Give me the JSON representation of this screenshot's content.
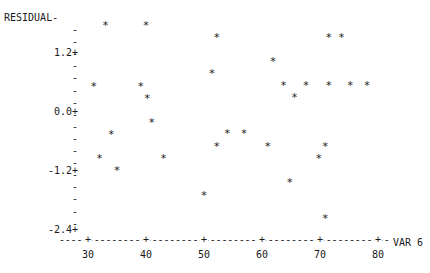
{
  "chart_data": {
    "type": "scatter",
    "title": "",
    "xlabel": "VAR 6",
    "ylabel": "RESIDUAL",
    "xlim": [
      26,
      84
    ],
    "ylim": [
      -2.6,
      1.9
    ],
    "x_ticks": [
      30,
      40,
      50,
      60,
      70,
      80
    ],
    "y_ticks": [
      1.2,
      0.0,
      -1.2,
      -2.4
    ],
    "y_tick_labels": [
      "1.2+",
      "0.0+",
      "-1.2+",
      "-2.4+"
    ],
    "grid": false,
    "legend": null,
    "marker": "*",
    "style": "line-printer",
    "series": [
      {
        "name": "residuals",
        "points": [
          {
            "x": 33.0,
            "y": 1.76
          },
          {
            "x": 40.0,
            "y": 1.76
          },
          {
            "x": 31.0,
            "y": 0.53
          },
          {
            "x": 39.1,
            "y": 0.53
          },
          {
            "x": 40.2,
            "y": 0.28
          },
          {
            "x": 41.0,
            "y": -0.2
          },
          {
            "x": 34.0,
            "y": -0.45
          },
          {
            "x": 32.0,
            "y": -0.94
          },
          {
            "x": 43.0,
            "y": -0.94
          },
          {
            "x": 35.0,
            "y": -1.18
          },
          {
            "x": 52.2,
            "y": 1.52
          },
          {
            "x": 51.4,
            "y": 0.79
          },
          {
            "x": 61.9,
            "y": 1.04
          },
          {
            "x": 63.7,
            "y": 0.55
          },
          {
            "x": 67.6,
            "y": 0.55
          },
          {
            "x": 65.6,
            "y": 0.3
          },
          {
            "x": 71.5,
            "y": 1.52
          },
          {
            "x": 73.7,
            "y": 1.52
          },
          {
            "x": 71.5,
            "y": 0.55
          },
          {
            "x": 75.2,
            "y": 0.55
          },
          {
            "x": 78.1,
            "y": 0.55
          },
          {
            "x": 54.0,
            "y": -0.43
          },
          {
            "x": 56.9,
            "y": -0.43
          },
          {
            "x": 52.2,
            "y": -0.69
          },
          {
            "x": 61.0,
            "y": -0.69
          },
          {
            "x": 70.9,
            "y": -0.69
          },
          {
            "x": 69.8,
            "y": -0.94
          },
          {
            "x": 64.8,
            "y": -1.42
          },
          {
            "x": 50.0,
            "y": -1.69
          },
          {
            "x": 70.9,
            "y": -2.16
          }
        ]
      }
    ]
  },
  "axes": {
    "y_label": "RESIDUAL-",
    "x_label": "VAR 6"
  }
}
